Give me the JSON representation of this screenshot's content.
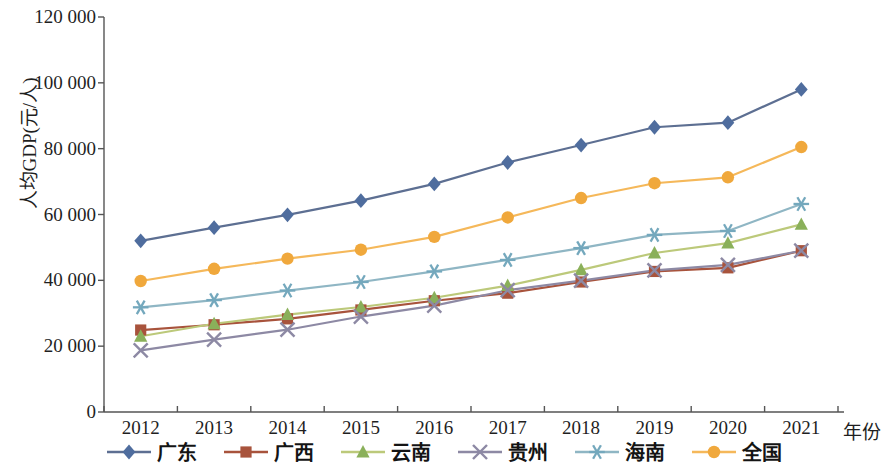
{
  "chart_data": {
    "type": "line",
    "title": "",
    "xlabel": "年份",
    "ylabel": "人均GDP(元/人)",
    "categories": [
      "2012",
      "2013",
      "2014",
      "2015",
      "2016",
      "2017",
      "2018",
      "2019",
      "2020",
      "2021"
    ],
    "x": [
      2012,
      2013,
      2014,
      2015,
      2016,
      2017,
      2018,
      2019,
      2020,
      2021
    ],
    "ylim": [
      0,
      120000
    ],
    "yticks": [
      0,
      20000,
      40000,
      60000,
      80000,
      100000,
      120000
    ],
    "ytick_labels": [
      "0",
      "20 000",
      "40 000",
      "60 000",
      "80 000",
      "100 000",
      "120 000"
    ],
    "grid": false,
    "legend_position": "bottom",
    "series": [
      {
        "name": "广东",
        "color": "#4f6d9e",
        "line_color": "#5d6f92",
        "marker": "diamond",
        "values": [
          52000,
          56000,
          59900,
          64200,
          69300,
          75800,
          81100,
          86500,
          87900,
          98000
        ]
      },
      {
        "name": "广西",
        "color": "#a8533c",
        "line_color": "#a8533c",
        "marker": "square",
        "values": [
          24900,
          26500,
          28300,
          31000,
          33800,
          36100,
          39500,
          42700,
          43800,
          49000
        ]
      },
      {
        "name": "云南",
        "color": "#8ab05a",
        "line_color": "#bcc97a",
        "marker": "triangle",
        "values": [
          23000,
          26800,
          29600,
          31900,
          34700,
          38400,
          43200,
          48300,
          51300,
          57000
        ]
      },
      {
        "name": "贵州",
        "color": "#8d89a4",
        "line_color": "#8d89a4",
        "marker": "cross",
        "values": [
          18700,
          22000,
          25000,
          29000,
          32300,
          37000,
          39900,
          43000,
          44700,
          49000
        ]
      },
      {
        "name": "海南",
        "color": "#74a8bd",
        "line_color": "#8fb6c4",
        "marker": "asterisk",
        "values": [
          31800,
          34000,
          36900,
          39500,
          42700,
          46200,
          49800,
          53800,
          55000,
          63200
        ]
      },
      {
        "name": "全国",
        "color": "#f0a83c",
        "line_color": "#f5b85a",
        "marker": "circle",
        "values": [
          39800,
          43500,
          46600,
          49300,
          53200,
          59100,
          65000,
          69500,
          71300,
          80500
        ]
      }
    ]
  }
}
